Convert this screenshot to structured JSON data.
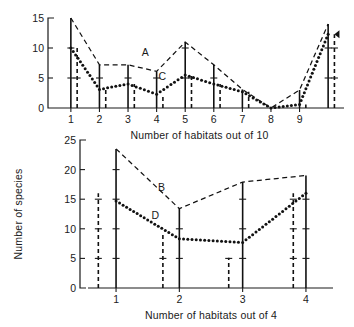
{
  "figure": {
    "title": "",
    "background_color": "#ffffff",
    "ink_color": "#111111"
  },
  "chart_data": [
    {
      "id": "top-panel",
      "type": "line",
      "title": "",
      "subtitle": "",
      "xlabel": "Number of habitats out of 10",
      "ylabel": "",
      "xlim": [
        0.55,
        10.45
      ],
      "ylim": [
        0,
        15
      ],
      "xticks": [
        1,
        2,
        3,
        4,
        5,
        6,
        7,
        8,
        9
      ],
      "xticklabels": [
        "1",
        "2",
        "3",
        "4",
        "5",
        "6",
        "7",
        "8",
        "9"
      ],
      "yticks": [
        0,
        5,
        10,
        15
      ],
      "yticklabels": [
        "0",
        "5",
        "10",
        "15"
      ],
      "grid": false,
      "legend_position": "inline-annotation",
      "x": [
        1,
        2,
        3,
        4,
        5,
        6,
        7,
        8,
        9,
        10
      ],
      "series": [
        {
          "name": "A",
          "style": "dashed",
          "label": "A",
          "label_x": 3.6,
          "label_y": 8.6,
          "values": [
            15,
            7.2,
            7.2,
            6.1,
            11,
            7.2,
            3.1,
            0,
            3.0,
            14
          ]
        },
        {
          "name": "C",
          "style": "dotted",
          "label": "C",
          "label_x": 4.2,
          "label_y": 4.6,
          "values": [
            10,
            3.1,
            4.0,
            2.3,
            5.5,
            4.0,
            2.7,
            0,
            0.6,
            12.3
          ]
        }
      ],
      "bars_solid": {
        "description": "solid vertical bars at integer habitat counts, heights follow series A",
        "x": [
          1,
          2,
          3,
          4,
          5,
          6,
          7,
          8,
          9,
          10
        ],
        "heights": [
          15,
          7.2,
          7.2,
          6.1,
          11,
          7.2,
          3.1,
          0,
          3.0,
          14
        ]
      },
      "bars_dashed": {
        "description": "dashed vertical bars offset right of each integer, heights follow series C",
        "x": [
          1.22,
          2.22,
          3.22,
          4.22,
          5.22,
          6.22,
          7.22,
          8.22,
          9.22,
          10.22
        ],
        "heights": [
          10,
          3.1,
          4.0,
          2.3,
          5.5,
          4.0,
          2.7,
          0,
          0.6,
          12.3
        ]
      },
      "annotations": [
        {
          "text": "arrowhead at top of rightmost dashed bar",
          "x": 10.22,
          "y": 12.3
        }
      ]
    },
    {
      "id": "bottom-panel",
      "type": "line",
      "title": "",
      "subtitle": "",
      "xlabel": "Number of habitats out of 4",
      "ylabel": "Number of species",
      "xlim": [
        0.62,
        4.38
      ],
      "ylim": [
        0,
        25
      ],
      "xticks": [
        1,
        2,
        3,
        4
      ],
      "xticklabels": [
        "1",
        "2",
        "3",
        "4"
      ],
      "yticks": [
        0,
        5,
        10,
        15,
        20,
        25
      ],
      "yticklabels": [
        "0",
        "5",
        "10",
        "15",
        "20",
        "25"
      ],
      "grid": false,
      "legend_position": "inline-annotation",
      "x": [
        1,
        2,
        3,
        4
      ],
      "series": [
        {
          "name": "B",
          "style": "dashed",
          "label": "B",
          "label_x": 1.72,
          "label_y": 16.4,
          "values": [
            23.5,
            13.4,
            17.9,
            19.0
          ]
        },
        {
          "name": "D",
          "style": "dotted",
          "label": "D",
          "label_x": 1.62,
          "label_y": 11.6,
          "values": [
            14.7,
            8.3,
            7.7,
            16.0
          ]
        }
      ],
      "bars_solid": {
        "description": "solid vertical bars at integer habitat counts, heights follow series B",
        "x": [
          1,
          2,
          3,
          4
        ],
        "heights": [
          23.5,
          13.4,
          17.9,
          19.0
        ]
      },
      "bars_dashed": {
        "description": "dashed vertical bars offset left of each integer, heights follow series D",
        "x": [
          0.72,
          1.74,
          2.78,
          3.8
        ],
        "heights": [
          16.0,
          9.0,
          5.1,
          16.0
        ]
      },
      "annotations": []
    }
  ],
  "top": {
    "xlabel": "Number of habitats out of 10",
    "yticklabels": [
      "15",
      "10",
      "5",
      "0"
    ],
    "xticklabels": [
      "1",
      "2",
      "3",
      "4",
      "5",
      "6",
      "7",
      "8",
      "9"
    ],
    "series_label_a": "A",
    "series_label_c": "C"
  },
  "bottom": {
    "xlabel": "Number of habitats out of 4",
    "ylabel": "Number of species",
    "yticklabels": [
      "25",
      "20",
      "15",
      "10",
      "5",
      "0"
    ],
    "xticklabels": [
      "1",
      "2",
      "3",
      "4"
    ],
    "series_label_b": "B",
    "series_label_d": "D"
  }
}
